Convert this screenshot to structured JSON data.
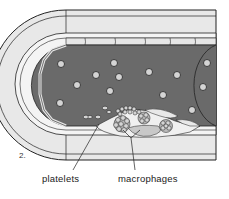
{
  "figure": {
    "panel_number": "2.",
    "labels": {
      "platelets": "platelets",
      "macrophages": "macrophages"
    },
    "colors": {
      "lumen": "#6a6a6a",
      "vessel_wall": "#e8e8e8",
      "cell_fill": "#d4d4d4",
      "outline": "#222222",
      "plaque_core": "#c8c8c8"
    }
  }
}
